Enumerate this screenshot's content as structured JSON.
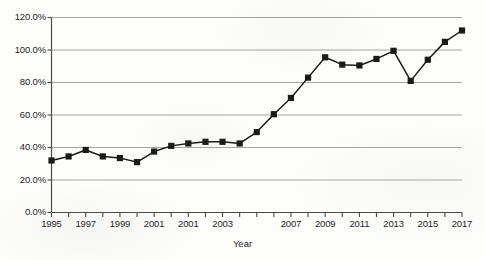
{
  "chart_data": {
    "type": "line",
    "title": "",
    "xlabel": "Year",
    "ylabel": "",
    "x": [
      1995,
      1996,
      1997,
      1998,
      1999,
      2000,
      2001,
      2002,
      2003,
      2004,
      2005,
      2006,
      2007,
      2008,
      2009,
      2010,
      2011,
      2012,
      2013,
      2014,
      2015,
      2016,
      2017,
      2018,
      2019
    ],
    "values": [
      32.0,
      34.5,
      38.5,
      34.5,
      33.5,
      31.0,
      37.5,
      41.0,
      42.5,
      43.5,
      43.5,
      42.5,
      49.5,
      60.5,
      70.5,
      83.0,
      95.5,
      91.0,
      90.5,
      94.5,
      99.5,
      81.0,
      94.0,
      105.0,
      112.0
    ],
    "marker": "square",
    "series": [
      {
        "name": "",
        "values": [
          32.0,
          34.5,
          38.5,
          34.5,
          33.5,
          31.0,
          37.5,
          41.0,
          42.5,
          43.5,
          43.5,
          42.5,
          49.5,
          60.5,
          70.5,
          83.0,
          95.5,
          91.0,
          90.5,
          94.5,
          99.5,
          81.0,
          94.0,
          105.0,
          112.0
        ]
      }
    ],
    "ylim": [
      0,
      120
    ],
    "ytick_values": [
      0,
      20,
      40,
      60,
      80,
      100,
      120
    ],
    "ytick_labels": [
      "0.0%",
      "20.0%",
      "40.0%",
      "60.0%",
      "80.0%",
      "100.0%",
      "120.0%"
    ],
    "xlim": [
      1995,
      2019
    ],
    "xtick_values": [
      1995,
      1996,
      1997,
      1998,
      1999,
      2000,
      2001,
      2002,
      2003,
      2004,
      2005,
      2006,
      2007,
      2008,
      2009,
      2010,
      2011,
      2012,
      2013,
      2014,
      2015,
      2016,
      2017,
      2018,
      2019
    ],
    "xtick_labels": [
      {
        "value": 1995,
        "label": "1995"
      },
      {
        "value": 1997,
        "label": "1997"
      },
      {
        "value": 1999,
        "label": "1999"
      },
      {
        "value": 2001,
        "label": "2001"
      },
      {
        "value": 2003,
        "label": "2001"
      },
      {
        "value": 2005,
        "label": "2003"
      },
      {
        "value": 2009,
        "label": "2007"
      },
      {
        "value": 2011,
        "label": "2009"
      },
      {
        "value": 2013,
        "label": "2011"
      },
      {
        "value": 2015,
        "label": "2013"
      },
      {
        "value": 2017,
        "label": "2015"
      },
      {
        "value": 2019,
        "label": "2017"
      }
    ],
    "grid": true,
    "grid_axis": "y",
    "legend": "none",
    "line_color": "#1a1a1a",
    "marker_color": "#1a1a1a",
    "grid_color": "#9a9a9a",
    "axis_color": "#4a4a4a",
    "background_color": "#fdfdfc"
  }
}
